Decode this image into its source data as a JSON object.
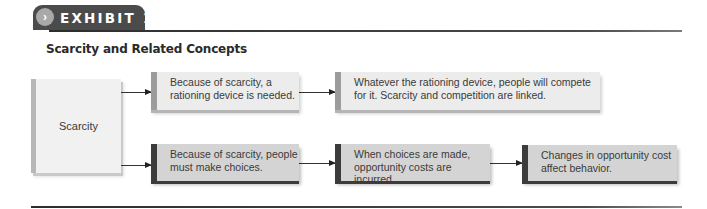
{
  "exhibit": {
    "label": "EXHIBIT 1",
    "marker_icon": "›"
  },
  "title": "Scarcity and Related Concepts",
  "root": {
    "label": "Scarcity"
  },
  "rows": [
    {
      "style": "light",
      "boxes": [
        {
          "lines": [
            "Because of scarcity, a",
            "rationing device is needed."
          ]
        },
        {
          "lines": [
            "Whatever the rationing device, people will compete",
            "for it. Scarcity and competition are linked."
          ]
        }
      ]
    },
    {
      "style": "dark",
      "boxes": [
        {
          "lines": [
            "Because of scarcity, people",
            "must make choices."
          ]
        },
        {
          "lines": [
            "When choices are made,",
            "opportunity costs are incurred."
          ]
        },
        {
          "lines": [
            "Changes in opportunity cost",
            "affect behavior."
          ]
        }
      ]
    }
  ],
  "colors": {
    "tab": "#4b4b4b",
    "light_accent": "#9c9c9c",
    "dark_accent": "#3c3c3c",
    "light_fill": "#ececec",
    "dark_fill": "#d4d4d4"
  }
}
